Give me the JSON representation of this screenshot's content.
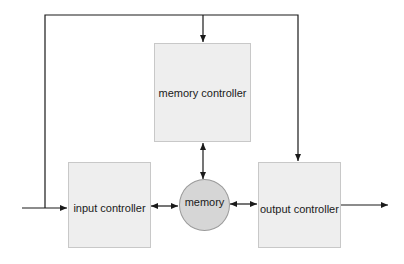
{
  "diagram": {
    "nodes": {
      "memory_controller": {
        "label": "memory controller",
        "shape": "rectangle"
      },
      "input_controller": {
        "label": "input controller",
        "shape": "rectangle"
      },
      "memory": {
        "label": "memory",
        "shape": "circle"
      },
      "output_controller": {
        "label": "output controller",
        "shape": "rectangle"
      }
    },
    "edges": [
      {
        "from": "external-input",
        "to": "input_controller",
        "direction": "one-way"
      },
      {
        "from": "input-line",
        "to": "memory_controller",
        "via": "top bus",
        "direction": "one-way"
      },
      {
        "from": "input-line",
        "to": "output_controller",
        "via": "top bus",
        "direction": "one-way"
      },
      {
        "from": "input_controller",
        "to": "memory",
        "direction": "two-way"
      },
      {
        "from": "memory_controller",
        "to": "memory",
        "direction": "two-way"
      },
      {
        "from": "memory",
        "to": "output_controller",
        "direction": "two-way"
      },
      {
        "from": "output_controller",
        "to": "external-output",
        "direction": "one-way"
      }
    ],
    "colors": {
      "box_fill": "#eeeeee",
      "box_border": "#c8c8c8",
      "circle_fill": "#d6d6d6",
      "line": "#1a1a1a"
    }
  }
}
